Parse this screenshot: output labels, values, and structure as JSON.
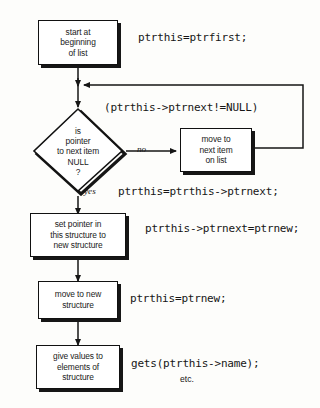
{
  "diagram": {
    "colors": {
      "line": "#161616",
      "box_fill": "#ffffff",
      "shadow": "#161616",
      "text": "#1a1a1a",
      "background": "#fdfdfb"
    },
    "nodes": [
      {
        "id": "start",
        "type": "process",
        "lines": [
          "start at",
          "beginning",
          "of list"
        ]
      },
      {
        "id": "decision",
        "type": "decision",
        "lines": [
          "is",
          "pointer",
          "to next item",
          "NULL",
          "?"
        ]
      },
      {
        "id": "move-next",
        "type": "process",
        "lines": [
          "move to",
          "next item",
          "on list"
        ]
      },
      {
        "id": "set-pointer",
        "type": "process",
        "lines": [
          "set pointer in",
          "this structure to",
          "new structure"
        ]
      },
      {
        "id": "move-new",
        "type": "process",
        "lines": [
          "move to new",
          "structure"
        ]
      },
      {
        "id": "give-values",
        "type": "process",
        "lines": [
          "give values to",
          "elements of",
          "structure"
        ]
      }
    ],
    "branch_labels": {
      "no": "no",
      "yes": "yes"
    },
    "code_annotations": [
      {
        "id": "code-start",
        "text": "ptrthis=ptrfirst;"
      },
      {
        "id": "code-condition",
        "text": "(ptrthis->ptrnext!=NULL)"
      },
      {
        "id": "code-move-next",
        "text": "ptrthis=ptrthis->ptrnext;"
      },
      {
        "id": "code-set-ptr",
        "text": "ptrthis->ptrnext=ptrnew;"
      },
      {
        "id": "code-move-new",
        "text": "ptrthis=ptrnew;"
      },
      {
        "id": "code-gets",
        "text": "gets(ptrthis->name);"
      },
      {
        "id": "code-etc",
        "text": "etc."
      }
    ]
  }
}
